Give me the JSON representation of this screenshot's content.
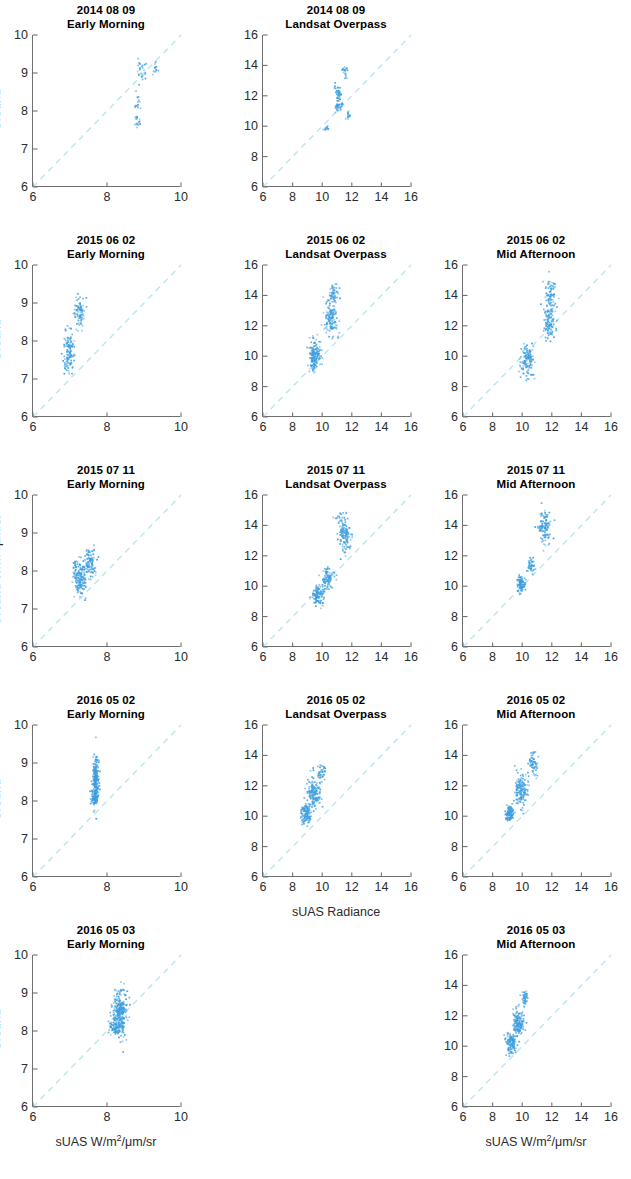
{
  "figure": {
    "type": "scatter-grid",
    "rows": 5,
    "columns": 3,
    "point_color": "#3f9fe0",
    "identity_line_color": "#b9e7ee",
    "axis_color": "#6f6f6f"
  },
  "axes": {
    "small_range": [
      6,
      10
    ],
    "small_ticks": [
      6,
      7,
      8,
      9,
      10
    ],
    "small_xticks": [
      6,
      8,
      10
    ],
    "large_range": [
      6,
      16
    ],
    "large_ticks": [
      6,
      8,
      10,
      12,
      14,
      16
    ],
    "large_xticks": [
      6,
      8,
      10,
      12,
      14,
      16
    ]
  },
  "labels": {
    "ylabel_plain": "Ground",
    "ylabel_units_prefix": "Ground W/m",
    "ylabel_units_sup": "2",
    "ylabel_units_suffix": "/μm/sr",
    "xlabel_units_prefix": "sUAS W/m",
    "xlabel_units_sup": "2",
    "xlabel_units_suffix": "/μm/sr",
    "xlabel_radiance": "sUAS Radiance"
  },
  "chart_data": {
    "type": "scatter",
    "xlabel": "sUAS W/m2/μm/sr",
    "ylabel": "Ground W/m2/μm/sr",
    "grid": false,
    "legend": "none",
    "annotations": [
      "dashed 1:1 identity line in each panel"
    ],
    "panels": [
      {
        "row": 1,
        "col": 1,
        "date": "2014 08 09",
        "time_of_day": "Early Morning",
        "xlim": [
          6,
          10
        ],
        "ylim": [
          6,
          10
        ],
        "xticks": [
          6,
          8,
          10
        ],
        "yticks": [
          6,
          7,
          8,
          9,
          10
        ],
        "ylabel": "Ground",
        "xlabel": "",
        "n_points": 70,
        "clusters": [
          {
            "x": 8.82,
            "y": 7.68,
            "sx": 0.04,
            "sy": 0.1,
            "n": 14
          },
          {
            "x": 8.83,
            "y": 8.17,
            "sx": 0.04,
            "sy": 0.13,
            "n": 16
          },
          {
            "x": 8.95,
            "y": 9.08,
            "sx": 0.07,
            "sy": 0.16,
            "n": 26
          },
          {
            "x": 9.3,
            "y": 9.1,
            "sx": 0.04,
            "sy": 0.09,
            "n": 14
          }
        ]
      },
      {
        "row": 1,
        "col": 2,
        "date": "2014 08 09",
        "time_of_day": "Landsat Overpass",
        "xlim": [
          6,
          16
        ],
        "ylim": [
          6,
          16
        ],
        "xticks": [
          6,
          8,
          10,
          12,
          14,
          16
        ],
        "yticks": [
          6,
          8,
          10,
          12,
          14,
          16
        ],
        "ylabel": "",
        "xlabel": "",
        "n_points": 110,
        "clusters": [
          {
            "x": 10.25,
            "y": 9.8,
            "sx": 0.13,
            "sy": 0.1,
            "n": 12
          },
          {
            "x": 11.1,
            "y": 11.3,
            "sx": 0.13,
            "sy": 0.22,
            "n": 34
          },
          {
            "x": 11.05,
            "y": 12.25,
            "sx": 0.12,
            "sy": 0.22,
            "n": 32
          },
          {
            "x": 11.55,
            "y": 13.65,
            "sx": 0.09,
            "sy": 0.22,
            "n": 20
          },
          {
            "x": 11.75,
            "y": 10.65,
            "sx": 0.08,
            "sy": 0.15,
            "n": 12
          }
        ]
      },
      {
        "row": 1,
        "col": 3,
        "date": "",
        "time_of_day": "",
        "empty": true
      },
      {
        "row": 2,
        "col": 1,
        "date": "2015 06 02",
        "time_of_day": "Early Morning",
        "xlim": [
          6,
          10
        ],
        "ylim": [
          6,
          10
        ],
        "xticks": [
          6,
          8,
          10
        ],
        "yticks": [
          6,
          7,
          8,
          9,
          10
        ],
        "ylabel": "Ground",
        "xlabel": "",
        "n_points": 200,
        "clusters": [
          {
            "x": 6.98,
            "y": 7.72,
            "sx": 0.07,
            "sy": 0.3,
            "n": 120
          },
          {
            "x": 7.26,
            "y": 8.72,
            "sx": 0.07,
            "sy": 0.22,
            "n": 80
          }
        ]
      },
      {
        "row": 2,
        "col": 2,
        "date": "2015 06 02",
        "time_of_day": "Landsat Overpass",
        "xlim": [
          6,
          16
        ],
        "ylim": [
          6,
          16
        ],
        "xticks": [
          6,
          8,
          10,
          12,
          14,
          16
        ],
        "yticks": [
          6,
          8,
          10,
          12,
          14,
          16
        ],
        "ylabel": "",
        "xlabel": "",
        "n_points": 330,
        "clusters": [
          {
            "x": 9.45,
            "y": 10.05,
            "sx": 0.2,
            "sy": 0.55,
            "n": 150
          },
          {
            "x": 10.6,
            "y": 12.55,
            "sx": 0.25,
            "sy": 0.7,
            "n": 130
          },
          {
            "x": 10.75,
            "y": 14.05,
            "sx": 0.18,
            "sy": 0.35,
            "n": 50
          }
        ]
      },
      {
        "row": 2,
        "col": 3,
        "date": "2015 06 02",
        "time_of_day": "Mid Afternoon",
        "xlim": [
          6,
          16
        ],
        "ylim": [
          6,
          16
        ],
        "xticks": [
          6,
          8,
          10,
          12,
          14,
          16
        ],
        "yticks": [
          6,
          8,
          10,
          12,
          14,
          16
        ],
        "ylabel": "",
        "xlabel": "",
        "n_points": 300,
        "clusters": [
          {
            "x": 10.35,
            "y": 9.7,
            "sx": 0.22,
            "sy": 0.55,
            "n": 120
          },
          {
            "x": 11.85,
            "y": 12.35,
            "sx": 0.2,
            "sy": 0.7,
            "n": 120
          },
          {
            "x": 11.95,
            "y": 14.05,
            "sx": 0.18,
            "sy": 0.55,
            "n": 60
          }
        ]
      },
      {
        "row": 3,
        "col": 1,
        "date": "2015 07 11",
        "time_of_day": "Early Morning",
        "xlim": [
          6,
          10
        ],
        "ylim": [
          6,
          10
        ],
        "xticks": [
          6,
          8,
          10
        ],
        "yticks": [
          6,
          7,
          8,
          9,
          10
        ],
        "ylabel": "Ground W/m2/μm/sr",
        "xlabel": "",
        "n_points": 260,
        "clusters": [
          {
            "x": 7.25,
            "y": 7.82,
            "sx": 0.09,
            "sy": 0.24,
            "n": 160
          },
          {
            "x": 7.55,
            "y": 8.18,
            "sx": 0.08,
            "sy": 0.2,
            "n": 100
          }
        ]
      },
      {
        "row": 3,
        "col": 2,
        "date": "2015 07 11",
        "time_of_day": "Landsat Overpass",
        "xlim": [
          6,
          16
        ],
        "ylim": [
          6,
          16
        ],
        "xticks": [
          6,
          8,
          10,
          12,
          14,
          16
        ],
        "yticks": [
          6,
          8,
          10,
          12,
          14,
          16
        ],
        "ylabel": "",
        "xlabel": "",
        "n_points": 330,
        "clusters": [
          {
            "x": 9.7,
            "y": 9.4,
            "sx": 0.18,
            "sy": 0.35,
            "n": 110
          },
          {
            "x": 10.35,
            "y": 10.45,
            "sx": 0.22,
            "sy": 0.4,
            "n": 90
          },
          {
            "x": 11.55,
            "y": 13.3,
            "sx": 0.22,
            "sy": 0.55,
            "n": 110
          },
          {
            "x": 11.3,
            "y": 14.55,
            "sx": 0.25,
            "sy": 0.25,
            "n": 20
          }
        ]
      },
      {
        "row": 3,
        "col": 3,
        "date": "2015 07 11",
        "time_of_day": "Mid Afternoon",
        "xlim": [
          6,
          16
        ],
        "ylim": [
          6,
          16
        ],
        "xticks": [
          6,
          8,
          10,
          12,
          14,
          16
        ],
        "yticks": [
          6,
          8,
          10,
          12,
          14,
          16
        ],
        "ylabel": "",
        "xlabel": "",
        "n_points": 240,
        "clusters": [
          {
            "x": 9.95,
            "y": 10.1,
            "sx": 0.13,
            "sy": 0.28,
            "n": 90
          },
          {
            "x": 10.6,
            "y": 11.45,
            "sx": 0.12,
            "sy": 0.3,
            "n": 40
          },
          {
            "x": 11.55,
            "y": 13.9,
            "sx": 0.22,
            "sy": 0.55,
            "n": 110
          }
        ]
      },
      {
        "row": 4,
        "col": 1,
        "date": "2016 05 02",
        "time_of_day": "Early Morning",
        "xlim": [
          6,
          10
        ],
        "ylim": [
          6,
          10
        ],
        "xticks": [
          6,
          8,
          10
        ],
        "yticks": [
          6,
          7,
          8,
          9,
          10
        ],
        "ylabel": "Ground",
        "xlabel": "",
        "n_points": 280,
        "clusters": [
          {
            "x": 7.7,
            "y": 8.55,
            "sx": 0.04,
            "sy": 0.3,
            "n": 220
          },
          {
            "x": 7.66,
            "y": 8.08,
            "sx": 0.05,
            "sy": 0.09,
            "n": 60
          }
        ]
      },
      {
        "row": 4,
        "col": 2,
        "date": "2016 05 02",
        "time_of_day": "Landsat Overpass",
        "xlim": [
          6,
          16
        ],
        "ylim": [
          6,
          16
        ],
        "xticks": [
          6,
          8,
          10,
          12,
          14,
          16
        ],
        "yticks": [
          6,
          8,
          10,
          12,
          14,
          16
        ],
        "ylabel": "",
        "xlabel": "sUAS Radiance",
        "n_points": 300,
        "clusters": [
          {
            "x": 8.85,
            "y": 10.15,
            "sx": 0.18,
            "sy": 0.35,
            "n": 110
          },
          {
            "x": 9.45,
            "y": 11.45,
            "sx": 0.22,
            "sy": 0.55,
            "n": 150
          },
          {
            "x": 9.95,
            "y": 12.85,
            "sx": 0.15,
            "sy": 0.3,
            "n": 40
          }
        ]
      },
      {
        "row": 4,
        "col": 3,
        "date": "2016 05 02",
        "time_of_day": "Mid Afternoon",
        "xlim": [
          6,
          16
        ],
        "ylim": [
          6,
          16
        ],
        "xticks": [
          6,
          8,
          10,
          12,
          14,
          16
        ],
        "yticks": [
          6,
          8,
          10,
          12,
          14,
          16
        ],
        "ylabel": "",
        "xlabel": "",
        "n_points": 300,
        "clusters": [
          {
            "x": 9.15,
            "y": 10.2,
            "sx": 0.15,
            "sy": 0.3,
            "n": 100
          },
          {
            "x": 9.95,
            "y": 11.75,
            "sx": 0.22,
            "sy": 0.55,
            "n": 140
          },
          {
            "x": 10.75,
            "y": 13.45,
            "sx": 0.18,
            "sy": 0.4,
            "n": 60
          }
        ]
      },
      {
        "row": 5,
        "col": 1,
        "date": "2016 05 03",
        "time_of_day": "Early Morning",
        "xlim": [
          6,
          10
        ],
        "ylim": [
          6,
          10
        ],
        "xticks": [
          6,
          8,
          10
        ],
        "yticks": [
          6,
          7,
          8,
          9,
          10
        ],
        "ylabel": "Ground",
        "xlabel": "sUAS W/m2/μm/sr",
        "n_points": 320,
        "clusters": [
          {
            "x": 8.35,
            "y": 8.5,
            "sx": 0.09,
            "sy": 0.3,
            "n": 260
          },
          {
            "x": 8.22,
            "y": 8.08,
            "sx": 0.08,
            "sy": 0.1,
            "n": 60
          }
        ]
      },
      {
        "row": 5,
        "col": 2,
        "date": "",
        "time_of_day": "",
        "empty": true
      },
      {
        "row": 5,
        "col": 3,
        "date": "2016 05 03",
        "time_of_day": "Mid Afternoon",
        "xlim": [
          6,
          16
        ],
        "ylim": [
          6,
          16
        ],
        "xticks": [
          6,
          8,
          10,
          12,
          14,
          16
        ],
        "yticks": [
          6,
          8,
          10,
          12,
          14,
          16
        ],
        "ylabel": "",
        "xlabel": "sUAS W/m2/μm/sr",
        "n_points": 300,
        "clusters": [
          {
            "x": 9.25,
            "y": 10.25,
            "sx": 0.16,
            "sy": 0.35,
            "n": 120
          },
          {
            "x": 9.75,
            "y": 11.55,
            "sx": 0.18,
            "sy": 0.5,
            "n": 140
          },
          {
            "x": 10.15,
            "y": 13.25,
            "sx": 0.1,
            "sy": 0.25,
            "n": 40
          }
        ]
      }
    ]
  }
}
